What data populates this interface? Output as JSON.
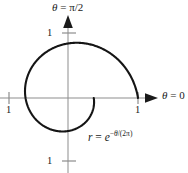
{
  "figure": {
    "background_color": "#ffffff",
    "curve_color": "#151515",
    "axis_color": "#8d8d8d"
  },
  "axis_labels": {
    "vertical": {
      "theta": "θ",
      "equals": " = ",
      "value": "π/2"
    },
    "horizontal": {
      "theta": "θ",
      "equals": " = ",
      "value": "0"
    }
  },
  "equation": {
    "r": "r",
    "equals": " = ",
    "base": "e",
    "exponent_minus": "−",
    "exponent_theta": "θ",
    "exponent_rest": "/(2π)"
  },
  "ticks": {
    "y_top": "1",
    "y_bottom": "1",
    "x_left": "1",
    "x_right": "1"
  },
  "chart_data": {
    "type": "line",
    "title": "",
    "subtitle": "",
    "xlabel": "θ = 0",
    "ylabel": "θ = π/2",
    "annotations": [
      "r = e^{−θ/(2π)}"
    ],
    "legend": [],
    "legend_position": "none",
    "grid": false,
    "coordinate_system": "polar",
    "xlim": [
      -1.0,
      1.35
    ],
    "ylim": [
      -1.07,
      1.4
    ],
    "xticks": [
      -1,
      1
    ],
    "xtick_labels": [
      "1",
      "1"
    ],
    "yticks": [
      -1,
      1
    ],
    "ytick_labels": [
      "1",
      "1"
    ],
    "origin_px": [
      68,
      98
    ],
    "unit_px": 70,
    "series": [
      {
        "name": "r = e^(-theta/(2*pi))",
        "formula": "r = exp(-theta/(2*pi))",
        "theta_start_rad": 0,
        "theta_end_rad": 6.283185307179586,
        "r_start": 1.0,
        "r_end": 0.36787944117144233,
        "points_polar": [
          {
            "theta_deg": 0,
            "r": 1.0
          },
          {
            "theta_deg": 30,
            "r": 0.92
          },
          {
            "theta_deg": 60,
            "r": 0.846
          },
          {
            "theta_deg": 90,
            "r": 0.779
          },
          {
            "theta_deg": 120,
            "r": 0.717
          },
          {
            "theta_deg": 150,
            "r": 0.659
          },
          {
            "theta_deg": 180,
            "r": 0.607
          },
          {
            "theta_deg": 210,
            "r": 0.558
          },
          {
            "theta_deg": 240,
            "r": 0.513
          },
          {
            "theta_deg": 270,
            "r": 0.472
          },
          {
            "theta_deg": 300,
            "r": 0.435
          },
          {
            "theta_deg": 330,
            "r": 0.4
          },
          {
            "theta_deg": 360,
            "r": 0.368
          }
        ]
      }
    ]
  }
}
